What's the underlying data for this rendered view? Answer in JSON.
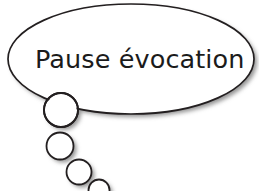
{
  "canvas": {
    "width": 259,
    "height": 191,
    "background_color": "#ffffff"
  },
  "bubble": {
    "shape_name": "thought-bubble-ellipse",
    "text": "Pause évocation",
    "text_color": "#1b1b1b",
    "outline_color": "#231f20",
    "fill_color": "#ffffff",
    "shadow_color": "#9a9a9a",
    "stroke_width": 1.6,
    "ellipse": {
      "cx": 131,
      "cy": 59,
      "rx": 123,
      "ry": 55
    },
    "text_position": {
      "x": 35,
      "baseline_y": 68
    }
  },
  "tail": {
    "shape_name": "thought-bubble-tail",
    "circle_count": 4,
    "circles": [
      {
        "cx": 61,
        "cy": 110,
        "r": 17.0,
        "label": "tail-circle-1"
      },
      {
        "cx": 60,
        "cy": 146,
        "r": 13.5,
        "label": "tail-circle-2"
      },
      {
        "cx": 79,
        "cy": 172,
        "r": 12.5,
        "label": "tail-circle-3"
      },
      {
        "cx": 99,
        "cy": 190,
        "r": 10.5,
        "label": "tail-circle-4"
      }
    ],
    "shadow_offset_x": 3,
    "shadow_offset_y": 3
  }
}
